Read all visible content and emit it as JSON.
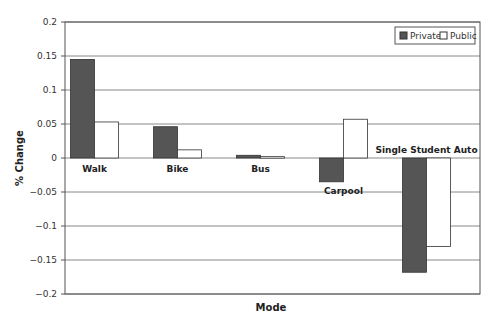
{
  "chart_data": {
    "type": "bar",
    "title": "",
    "xlabel": "Mode",
    "ylabel": "% Change",
    "ylim": [
      -0.2,
      0.2
    ],
    "yticks": [
      0.2,
      0.15,
      0.1,
      0.05,
      0,
      -0.05,
      -0.1,
      -0.15,
      -0.2
    ],
    "ytick_labels": [
      "0.2",
      "0.15",
      "0.1",
      "0.05",
      "0",
      "−0.05",
      "−0.1",
      "−0.15",
      "−0.2"
    ],
    "grid": true,
    "legend_position": "top-right",
    "categories": [
      "Walk",
      "Bike",
      "Bus",
      "Carpool",
      "Single Student Auto"
    ],
    "series": [
      {
        "name": "Private",
        "color": "#555555",
        "values": [
          0.145,
          0.046,
          0.004,
          -0.035,
          -0.168
        ]
      },
      {
        "name": "Public",
        "color": "#ffffff",
        "values": [
          0.053,
          0.012,
          0.002,
          0.057,
          -0.13
        ]
      }
    ]
  },
  "legend": {
    "items": [
      {
        "label": "Private",
        "swatch": "#555555"
      },
      {
        "label": "Public",
        "swatch": "#ffffff"
      }
    ]
  }
}
